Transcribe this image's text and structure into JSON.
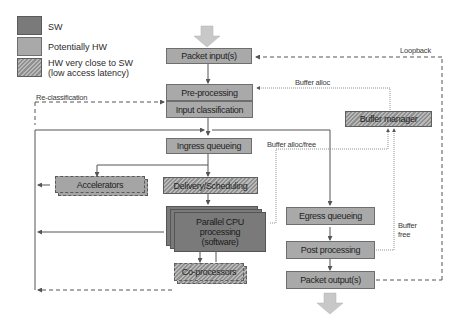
{
  "legend": {
    "items": [
      {
        "label": "SW",
        "style": "solid-dark",
        "color": "#7a7a7a"
      },
      {
        "label": "Potentially HW",
        "style": "solid-light",
        "color": "#a9a9a9"
      },
      {
        "label": "HW very close to SW",
        "label_line2": "(low access latency)",
        "style": "hatched"
      }
    ]
  },
  "nodes": {
    "packet_input": "Packet input(s)",
    "pre_processing": "Pre-processing",
    "input_classification": "Input classification",
    "ingress_queueing": "Ingress queueing",
    "delivery_scheduling": "Delivery/Scheduling",
    "accelerators": "Accelerators",
    "parallel_cpu_line1": "Parallel CPU",
    "parallel_cpu_line2": "processing",
    "parallel_cpu_line3": "(software)",
    "co_processors": "Co-processors",
    "buffer_manager": "Buffer manager",
    "egress_queueing": "Egress queueing",
    "post_processing": "Post processing",
    "packet_output": "Packet output(s)"
  },
  "edge_labels": {
    "loopback": "Loopback",
    "buffer_alloc": "Buffer alloc",
    "re_classification": "Re-classification",
    "buffer_alloc_free": "Buffer alloc/free",
    "buffer_free_line1": "Buffer",
    "buffer_free_line2": "free"
  },
  "colors": {
    "sw": "#7a7a7a",
    "potentially_hw": "#a9a9a9",
    "hatch_dark": "#8f8f8f",
    "hatch_light": "#b9b9b9",
    "arrow": "#c4c4c4",
    "line": "#555555"
  }
}
